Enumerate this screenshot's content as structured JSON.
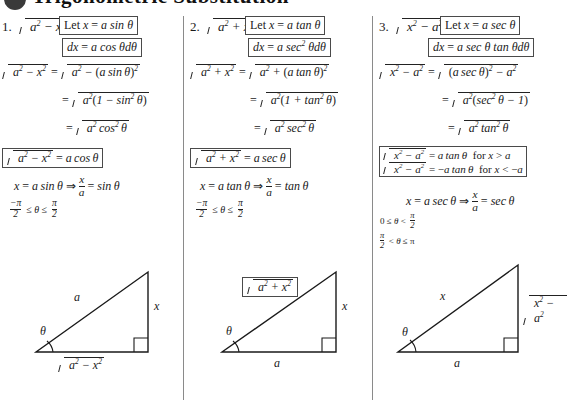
{
  "heading": {
    "text": "Trigonometric Substitution",
    "bullet": "bullet-dot"
  },
  "columns": [
    {
      "number": "1.",
      "expression": "a² − x²",
      "let_box": "Let x = a sin θ",
      "dx_box": "dx = a cos θ dθ",
      "steps": [
        "√(a² − x²) = √(a² − (a sin θ)²)",
        "= √(a²(1 − sin² θ))",
        "= √(a² cos² θ)"
      ],
      "result_box": "√(a² − x²) = a cos θ",
      "inverse": "x = a sin θ ⇒ x/a = sin θ",
      "domain": "−π/2 ≤ θ ≤ π/2",
      "triangle": {
        "hypotenuse": "a",
        "opposite": "x",
        "adjacent": "√(a² − x²)",
        "angle": "θ"
      }
    },
    {
      "number": "2.",
      "expression": "a² + x²",
      "let_box": "Let x = a tan θ",
      "dx_box": "dx = a sec² θ dθ",
      "steps": [
        "√(a² + x²) = √(a² + (a tan θ)²)",
        "= √(a²(1 + tan² θ))",
        "= √(a² sec² θ)"
      ],
      "result_box": "√(a² + x²) = a sec θ",
      "inverse": "x = a tan θ ⇒ x/a = tan θ",
      "domain": "−π/2 ≤ θ ≤ π/2",
      "triangle": {
        "hypotenuse": "√(a² + x²)",
        "opposite": "x",
        "adjacent": "a",
        "angle": "θ"
      }
    },
    {
      "number": "3.",
      "expression": "x² − a²",
      "let_box": "Let x = a sec θ",
      "dx_box": "dx = a sec θ tan θ dθ",
      "steps": [
        "√(x² − a²) = √((a sec θ)² − a²)",
        "= √(a²(sec² θ − 1))",
        "= √(a² tan² θ)"
      ],
      "result_box_line1": "√(x² − a²) = a tan θ   for x > a",
      "result_box_line2": "√(x² − a²) = −a tan θ   for x < −a",
      "inverse": "x = a sec θ ⇒ x/a = sec θ",
      "domain_line1": "0 ≤ θ < π/2",
      "domain_line2": "π/2 < θ ≤ π",
      "triangle": {
        "hypotenuse": "x",
        "opposite": "√(x² − a²)",
        "adjacent": "a",
        "angle": "θ"
      }
    }
  ]
}
